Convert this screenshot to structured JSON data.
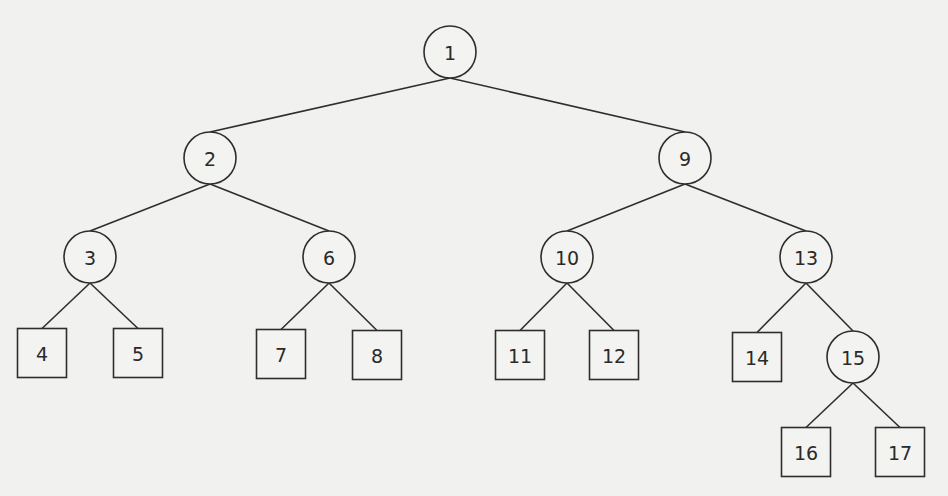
{
  "diagram": {
    "type": "binary-tree",
    "nodes": [
      {
        "id": "1",
        "label": "1",
        "shape": "circle",
        "x": 450,
        "y": 52
      },
      {
        "id": "2",
        "label": "2",
        "shape": "circle",
        "x": 210,
        "y": 158
      },
      {
        "id": "9",
        "label": "9",
        "shape": "circle",
        "x": 685,
        "y": 158
      },
      {
        "id": "3",
        "label": "3",
        "shape": "circle",
        "x": 90,
        "y": 257
      },
      {
        "id": "6",
        "label": "6",
        "shape": "circle",
        "x": 329,
        "y": 257
      },
      {
        "id": "10",
        "label": "10",
        "shape": "circle",
        "x": 567,
        "y": 257
      },
      {
        "id": "13",
        "label": "13",
        "shape": "circle",
        "x": 806,
        "y": 257
      },
      {
        "id": "4",
        "label": "4",
        "shape": "square",
        "x": 42,
        "y": 353
      },
      {
        "id": "5",
        "label": "5",
        "shape": "square",
        "x": 138,
        "y": 353
      },
      {
        "id": "7",
        "label": "7",
        "shape": "square",
        "x": 281,
        "y": 354
      },
      {
        "id": "8",
        "label": "8",
        "shape": "square",
        "x": 377,
        "y": 355
      },
      {
        "id": "11",
        "label": "11",
        "shape": "square",
        "x": 520,
        "y": 355
      },
      {
        "id": "12",
        "label": "12",
        "shape": "square",
        "x": 614,
        "y": 355
      },
      {
        "id": "14",
        "label": "14",
        "shape": "square",
        "x": 757,
        "y": 357
      },
      {
        "id": "15",
        "label": "15",
        "shape": "circle",
        "x": 853,
        "y": 357
      },
      {
        "id": "16",
        "label": "16",
        "shape": "square",
        "x": 806,
        "y": 452
      },
      {
        "id": "17",
        "label": "17",
        "shape": "square",
        "x": 900,
        "y": 452
      }
    ],
    "edges": [
      [
        "1",
        "2"
      ],
      [
        "1",
        "9"
      ],
      [
        "2",
        "3"
      ],
      [
        "2",
        "6"
      ],
      [
        "9",
        "10"
      ],
      [
        "9",
        "13"
      ],
      [
        "3",
        "4"
      ],
      [
        "3",
        "5"
      ],
      [
        "6",
        "7"
      ],
      [
        "6",
        "8"
      ],
      [
        "10",
        "11"
      ],
      [
        "10",
        "12"
      ],
      [
        "13",
        "14"
      ],
      [
        "13",
        "15"
      ],
      [
        "15",
        "16"
      ],
      [
        "15",
        "17"
      ]
    ],
    "circle_radius": 26,
    "square_size": 49
  }
}
